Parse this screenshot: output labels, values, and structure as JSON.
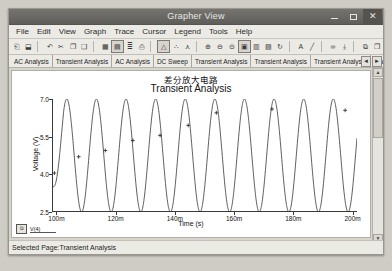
{
  "window": {
    "title": "Grapher View",
    "controls": {
      "minimize": "minimize-icon",
      "maximize": "maximize-icon",
      "close": "close-icon"
    }
  },
  "menu": {
    "items": [
      {
        "label": "File"
      },
      {
        "label": "Edit"
      },
      {
        "label": "View"
      },
      {
        "label": "Graph"
      },
      {
        "label": "Trace"
      },
      {
        "label": "Cursor"
      },
      {
        "label": "Legend"
      },
      {
        "label": "Tools"
      },
      {
        "label": "Help"
      }
    ]
  },
  "toolbar": {
    "buttons": [
      {
        "name": "open-file-button",
        "glyph": "⎗"
      },
      {
        "name": "save-button",
        "glyph": "⬓"
      },
      {
        "name": "undo-button",
        "glyph": "↶"
      },
      {
        "name": "cut-button",
        "glyph": "✂"
      },
      {
        "name": "copy-button",
        "glyph": "❐"
      },
      {
        "name": "paste-button",
        "glyph": "❑"
      },
      {
        "name": "show-grid-button",
        "glyph": "▦"
      },
      {
        "name": "show-legend-button",
        "glyph": "▤"
      },
      {
        "name": "properties-button",
        "glyph": "≣"
      },
      {
        "name": "print-button",
        "glyph": "⎙"
      },
      {
        "name": "cursor-tool-button",
        "glyph": "△"
      },
      {
        "name": "add-trace-button",
        "glyph": "∴"
      },
      {
        "name": "reverse-trace-button",
        "glyph": "⋏"
      },
      {
        "name": "zoom-in-button",
        "glyph": "⊕"
      },
      {
        "name": "zoom-out-button",
        "glyph": "⊖"
      },
      {
        "name": "zoom-restore-button",
        "glyph": "⊝"
      },
      {
        "name": "zoom-fit-button",
        "glyph": "▣"
      },
      {
        "name": "grid-toggle-button",
        "glyph": "▥"
      },
      {
        "name": "axis-settings-button",
        "glyph": "▨"
      },
      {
        "name": "refresh-button",
        "glyph": "↻"
      },
      {
        "name": "text-tool-button",
        "glyph": "A"
      },
      {
        "name": "line-tool-button",
        "glyph": "╱"
      },
      {
        "name": "measure-button",
        "glyph": "∞"
      },
      {
        "name": "export-button",
        "glyph": "⤓"
      },
      {
        "name": "copy-page-button",
        "glyph": "⧉"
      },
      {
        "name": "duplicate-page-button",
        "glyph": "❐"
      }
    ]
  },
  "tabs": {
    "items": [
      {
        "label": "AC Analysis"
      },
      {
        "label": "Transient Analysis"
      },
      {
        "label": "AC Analysis"
      },
      {
        "label": "DC Sweep"
      },
      {
        "label": "Transient Analysis"
      },
      {
        "label": "Transient Analysis"
      },
      {
        "label": "Transient Analysis"
      },
      {
        "label": "Transient A"
      }
    ],
    "nav": {
      "prev": "◄",
      "next": "►"
    }
  },
  "status": {
    "text": "Selected Page:Transient Analysis"
  },
  "legend": {
    "icon_label": "⧉",
    "trace_label": "V(4)"
  },
  "scrollbars": {
    "vertical": {
      "up": "▲",
      "down": "▼"
    },
    "horizontal": {
      "left": "◄",
      "right": "►"
    }
  },
  "chart_data": {
    "type": "line",
    "title": "差分放大电路",
    "subtitle": "Transient Analysis",
    "xlabel": "Time (s)",
    "ylabel": "Voltage (V)",
    "xlim": [
      0.0985,
      0.2015
    ],
    "ylim": [
      2.5,
      7.0
    ],
    "xticks": [
      0.1,
      0.12,
      0.14,
      0.16,
      0.18,
      0.2
    ],
    "xticklabels": [
      "100m",
      "120m",
      "140m",
      "160m",
      "180m",
      "200m"
    ],
    "yticks": [
      2.5,
      4.0,
      5.5,
      7.0
    ],
    "yticklabels": [
      "2.5",
      "4.0",
      "5.5",
      "7.0"
    ],
    "grid": false,
    "legend_position": "bottom-left",
    "series": [
      {
        "name": "V(4)",
        "color": "#333333",
        "marker": "plus",
        "waveform": "sine",
        "amplitude": 2.25,
        "offset": 4.75,
        "frequency_hz": 100,
        "phase_deg": -90,
        "marker_points": [
          {
            "x": 0.0993,
            "y": 4.05
          },
          {
            "x": 0.1075,
            "y": 4.7
          },
          {
            "x": 0.1165,
            "y": 4.95
          },
          {
            "x": 0.1258,
            "y": 5.35
          },
          {
            "x": 0.135,
            "y": 5.55
          },
          {
            "x": 0.1445,
            "y": 5.95
          },
          {
            "x": 0.154,
            "y": 6.45
          },
          {
            "x": 0.1728,
            "y": 6.6
          },
          {
            "x": 0.1975,
            "y": 6.55
          }
        ]
      }
    ]
  }
}
